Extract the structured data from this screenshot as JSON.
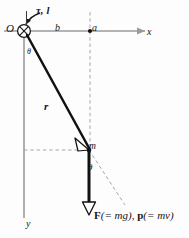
{
  "figure": {
    "kind": "physics-vector-diagram",
    "colors": {
      "axis": "#9a9a9a",
      "vector": "#111111",
      "dashed": "#9a9a9a",
      "text": "#161616",
      "background": "#fdfdfd"
    },
    "labels": {
      "origin": "O",
      "torque_angular_momentum": "τ, l",
      "moment_arm": "b",
      "point_a": "a",
      "x_axis": "x",
      "y_axis": "y",
      "position_vector": "r",
      "angle_at_origin": "θ",
      "mass": "m",
      "angle_at_mass": "θ",
      "force_momentum": {
        "force_symbol": "F",
        "force_value": "(= mg),",
        "momentum_symbol": "p",
        "momentum_value": "(= mv)"
      }
    },
    "geometry": {
      "origin": {
        "x": 24,
        "y": 31
      },
      "point_a": {
        "x": 90,
        "y": 31
      },
      "mass": {
        "x": 89,
        "y": 150
      },
      "force_tip": {
        "x": 89,
        "y": 215
      },
      "x_axis_end": {
        "x": 143,
        "y": 31
      },
      "y_axis_end": {
        "x": 24,
        "y": 216
      }
    }
  }
}
